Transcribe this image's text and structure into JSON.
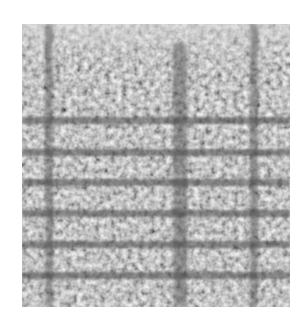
{
  "image": {
    "description": "Noisy grayscale texture of a grid with horizontal dark bands and vertical streaks over illegible glyph-like blotches",
    "background_color": "#ffffff",
    "texture": {
      "x": 22,
      "y": 24,
      "width": 268,
      "height": 283,
      "base_color": "#b4b4b4",
      "dark_color": "#464646"
    },
    "horizontal_bands_y": [
      96,
      128,
      158,
      189,
      220,
      251
    ],
    "vertical_streaks_x": [
      28,
      156,
      233
    ]
  }
}
